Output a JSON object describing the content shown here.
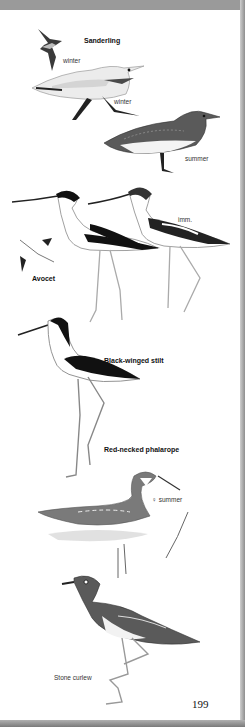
{
  "page": {
    "number": "199",
    "species": [
      {
        "name": "Sanderling",
        "plumage_labels": [
          "winter",
          "winter",
          "summer"
        ]
      },
      {
        "name": "Avocet",
        "plumage_labels": [
          "imm."
        ]
      },
      {
        "name": "Black-winged stilt",
        "plumage_labels": []
      },
      {
        "name": "Red-necked phalarope",
        "plumage_labels": [
          "♀ summer"
        ]
      },
      {
        "name": "Stone curlew",
        "plumage_labels": []
      }
    ]
  },
  "labels": {
    "sanderling": "Sanderling",
    "sanderling_flight": "winter",
    "sanderling_winter": "winter",
    "sanderling_summer": "summer",
    "avocet": "Avocet",
    "avocet_imm": "imm.",
    "stilt": "Black-winged stilt",
    "phalarope": "Red-necked phalarope",
    "phalarope_summer": "♀ summer",
    "stone_curlew": "Stone curlew"
  }
}
